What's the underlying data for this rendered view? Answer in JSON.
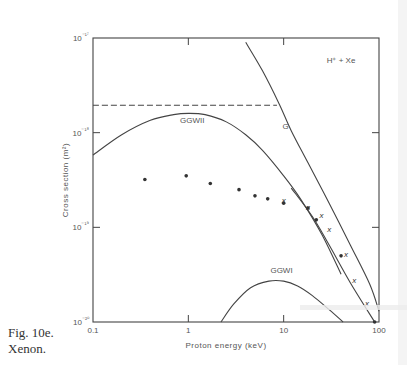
{
  "caption": {
    "figure": "Fig. 10e.",
    "subject": "Xenon."
  },
  "chart_data": {
    "type": "line",
    "title": "H⁺ + Xe",
    "xlabel": "Proton energy (keV)",
    "ylabel": "Cross section (m²)",
    "xscale": "log",
    "yscale": "log",
    "xlim": [
      0.1,
      100
    ],
    "ylim": [
      1e-20,
      1e-17
    ],
    "x_ticks": [
      0.1,
      1,
      10,
      100
    ],
    "x_tick_labels": [
      "0.1",
      "1",
      "10",
      "100"
    ],
    "y_ticks": [
      1e-20,
      1e-19,
      1e-18,
      1e-17
    ],
    "y_tick_labels": [
      "10⁻²⁰",
      "10⁻¹⁹",
      "10⁻¹⁸",
      "10⁻¹⁷"
    ],
    "grid": false,
    "legend": "none (curves labelled inline)",
    "series": [
      {
        "name": "GGWII",
        "style": "solid",
        "x": [
          0.1,
          0.2,
          0.4,
          0.7,
          1.0,
          1.5,
          2.5,
          4,
          6,
          10,
          15,
          25,
          40
        ],
        "y": [
          5.8e-19,
          9.5e-19,
          1.35e-18,
          1.55e-18,
          1.6e-18,
          1.55e-18,
          1.3e-18,
          9.5e-19,
          6.5e-19,
          3.5e-19,
          2e-19,
          8.5e-20,
          3.2e-20
        ]
      },
      {
        "name": "G",
        "style": "solid",
        "x": [
          4.0,
          6.0,
          9.0,
          12,
          18,
          30,
          50,
          80,
          100
        ],
        "y": [
          9e-18,
          4.5e-18,
          2e-18,
          1.05e-18,
          4.8e-19,
          1.8e-19,
          6.5e-20,
          2.5e-20,
          1.3e-20
        ]
      },
      {
        "name": "G (shifted lower line)",
        "style": "solid",
        "x": [
          12,
          20,
          30,
          50,
          90
        ],
        "y": [
          2.6e-19,
          1.3e-19,
          6.5e-20,
          2.6e-20,
          1e-20
        ]
      },
      {
        "name": "Dashed limit",
        "style": "dashed",
        "x": [
          0.1,
          8.5
        ],
        "y": [
          1.95e-18,
          1.95e-18
        ]
      },
      {
        "name": "GGWI",
        "style": "solid",
        "x": [
          2.2,
          3,
          4.5,
          7,
          10,
          14,
          20,
          30,
          42
        ],
        "y": [
          1e-20,
          1.55e-20,
          2.3e-20,
          2.7e-20,
          2.7e-20,
          2.4e-20,
          1.9e-20,
          1.35e-20,
          1e-20
        ]
      },
      {
        "name": "Experiment (dots)",
        "style": "marker-dot",
        "x": [
          0.35,
          0.95,
          1.7,
          3.4,
          5.0,
          6.8,
          10,
          18,
          22,
          40,
          90
        ],
        "y": [
          3.2e-19,
          3.5e-19,
          2.9e-19,
          2.5e-19,
          2.15e-19,
          2e-19,
          1.8e-19,
          1.6e-19,
          1.2e-19,
          5e-20,
          1e-20
        ]
      },
      {
        "name": "Experiment (crosses)",
        "style": "marker-x",
        "x": [
          10,
          18,
          25,
          30,
          45,
          55,
          75
        ],
        "y": [
          1.95e-19,
          1.65e-19,
          1.35e-19,
          9.5e-20,
          5.2e-20,
          2.8e-20,
          1.6e-20
        ]
      }
    ],
    "annotations": [
      {
        "text": "H⁺ + Xe",
        "x": 40,
        "y": 5.5e-18
      },
      {
        "text": "GGWII",
        "x": 1.1,
        "y": 1.25e-18
      },
      {
        "text": "G",
        "x": 10.5,
        "y": 1.1e-18
      },
      {
        "text": "GGWI",
        "x": 9.5,
        "y": 3.3e-20
      }
    ]
  }
}
